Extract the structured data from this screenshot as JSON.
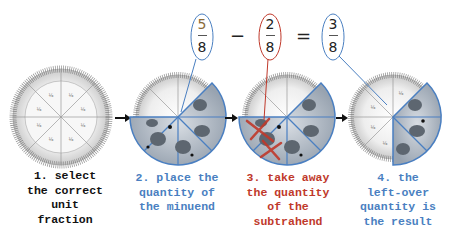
{
  "equation": {
    "minuend": {
      "numerator": "5",
      "denominator": "8",
      "color": "#4a7fc1"
    },
    "minus_sign": "−",
    "subtrahend": {
      "numerator": "2",
      "denominator": "8",
      "color": "#c0392b"
    },
    "equals_sign": "=",
    "result": {
      "numerator": "3",
      "denominator": "8",
      "color": "#4a7fc1"
    }
  },
  "steps": [
    {
      "label": "1. select\nthe correct\nunit\nfraction",
      "color": "#111111"
    },
    {
      "label": "2. place the\nquantity of\nthe minuend",
      "color": "#4a7fc1"
    },
    {
      "label": "3. take away\nthe quantity\nof the\nsubtrahend",
      "color": "#c0392b"
    },
    {
      "label": "4. the\nleft-over\nquantity is\nthe result",
      "color": "#4a7fc1"
    }
  ],
  "slice_label": "1/8",
  "colors": {
    "blue_outline": "#4a7fc1",
    "red_mark": "#c0392b",
    "plate": "#f2f2f2",
    "pizza": "#bfc6cf"
  }
}
